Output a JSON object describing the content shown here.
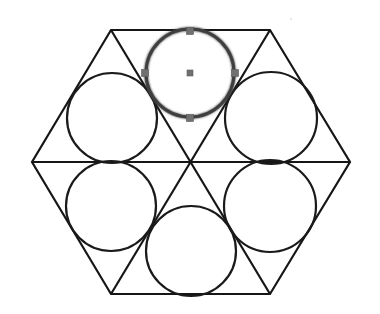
{
  "diagram": {
    "canvas": {
      "width": 380,
      "height": 314,
      "background": "#ffffff"
    },
    "stroke_color": "#161616",
    "hexagon": {
      "vertices": [
        [
          111,
          30
        ],
        [
          270,
          30
        ],
        [
          350,
          162
        ],
        [
          270,
          294
        ],
        [
          111,
          294
        ],
        [
          32,
          162
        ]
      ],
      "center": [
        191,
        162
      ]
    },
    "triangulation_lines": [
      {
        "from": [
          111,
          30
        ],
        "to": [
          270,
          294
        ]
      },
      {
        "from": [
          270,
          30
        ],
        "to": [
          111,
          294
        ]
      },
      {
        "from": [
          32,
          162
        ],
        "to": [
          350,
          162
        ]
      }
    ],
    "circles": [
      {
        "id": "top",
        "cx": 190,
        "cy": 73,
        "r": 44,
        "selected": true
      },
      {
        "id": "upper-left",
        "cx": 112,
        "cy": 118,
        "r": 45,
        "selected": false
      },
      {
        "id": "upper-right",
        "cx": 271,
        "cy": 118,
        "r": 46,
        "selected": false
      },
      {
        "id": "lower-left",
        "cx": 111,
        "cy": 206,
        "r": 45,
        "selected": false
      },
      {
        "id": "lower-right",
        "cx": 270,
        "cy": 206,
        "r": 46,
        "selected": false
      },
      {
        "id": "bottom",
        "cx": 191,
        "cy": 251,
        "r": 45,
        "selected": false
      }
    ],
    "selection": {
      "handle_color": "#707070",
      "handle_size": 7,
      "handles": [
        {
          "name": "top",
          "x": 190,
          "y": 31
        },
        {
          "name": "left",
          "x": 145,
          "y": 73
        },
        {
          "name": "right",
          "x": 235,
          "y": 73
        },
        {
          "name": "bottom",
          "x": 190,
          "y": 118
        },
        {
          "name": "center",
          "x": 190,
          "y": 73
        }
      ]
    }
  }
}
